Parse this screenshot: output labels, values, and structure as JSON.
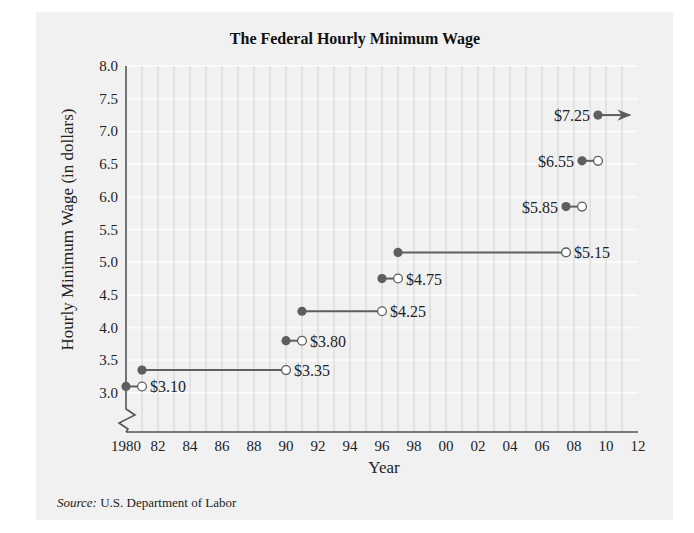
{
  "chart_data": {
    "type": "line",
    "subtype": "step-function (filled dot = included start, open dot = excluded end)",
    "title": "The Federal Hourly Minimum Wage",
    "xlabel": "Year",
    "ylabel": "Hourly Minimum Wage (in dollars)",
    "xlim": [
      1980,
      2012
    ],
    "ylim": [
      3.0,
      8.0
    ],
    "y_axis_break": true,
    "grid": {
      "vertical": "every year",
      "horizontal": "every 0.5"
    },
    "x_tick_labels": [
      "1980",
      "82",
      "84",
      "86",
      "88",
      "90",
      "92",
      "94",
      "96",
      "98",
      "00",
      "02",
      "04",
      "06",
      "08",
      "10",
      "12"
    ],
    "y_tick_labels": [
      "3.0",
      "3.5",
      "4.0",
      "4.5",
      "5.0",
      "5.5",
      "6.0",
      "6.5",
      "7.0",
      "7.5",
      "8.0"
    ],
    "segments": [
      {
        "start": 1980.0,
        "end": 1981.0,
        "value": 3.1,
        "label": "$3.10",
        "end_open": true
      },
      {
        "start": 1981.0,
        "end": 1990.0,
        "value": 3.35,
        "label": "$3.35",
        "end_open": true
      },
      {
        "start": 1990.0,
        "end": 1991.0,
        "value": 3.8,
        "label": "$3.80",
        "end_open": true
      },
      {
        "start": 1991.0,
        "end": 1996.0,
        "value": 4.25,
        "label": "$4.25",
        "end_open": true
      },
      {
        "start": 1996.0,
        "end": 1997.0,
        "value": 4.75,
        "label": "$4.75",
        "end_open": true
      },
      {
        "start": 1997.0,
        "end": 2007.5,
        "value": 5.15,
        "label": "$5.15",
        "end_open": true
      },
      {
        "start": 2007.5,
        "end": 2008.5,
        "value": 5.85,
        "label": "$5.85",
        "end_open": true
      },
      {
        "start": 2008.5,
        "end": 2009.5,
        "value": 6.55,
        "label": "$6.55",
        "end_open": true
      },
      {
        "start": 2009.5,
        "end": 2011.5,
        "value": 7.25,
        "label": "$7.25",
        "end_open": false,
        "continues": "arrow"
      }
    ],
    "source": "U.S. Department of Labor"
  },
  "footer": {
    "source_prefix": "Source:",
    "source_text": " U.S. Department of Labor"
  },
  "colors": {
    "background": "#ffffff",
    "panel": "#f1f1f1",
    "grid": "#d2d2d2",
    "grid_h": "#fbfbfb",
    "axis": "#555555",
    "series": "#5e5e5e",
    "text": "#222222"
  }
}
